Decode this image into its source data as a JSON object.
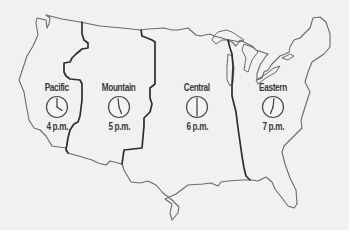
{
  "map": {
    "title": "U.S. Time Zones",
    "zones": [
      {
        "id": "pacific",
        "name": "Pacific",
        "time": "4 p.m.",
        "hour": 4
      },
      {
        "id": "mountain",
        "name": "Mountain",
        "time": "5 p.m.",
        "hour": 5
      },
      {
        "id": "central",
        "name": "Central",
        "time": "6 p.m.",
        "hour": 6
      },
      {
        "id": "eastern",
        "name": "Eastern",
        "time": "7 p.m.",
        "hour": 7
      }
    ],
    "colors": {
      "background": "#f1f1f1",
      "outline": "#6a6a6a",
      "zone_boundary": "#2e2e2e",
      "text": "#3a3a3a"
    }
  }
}
